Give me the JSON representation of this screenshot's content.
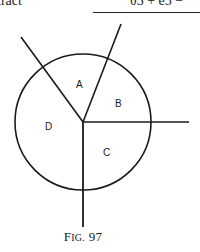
{
  "header": {
    "left_text": "tract",
    "right_text": "θ3 + e5 −"
  },
  "figure": {
    "caption_prefix_big": "F",
    "caption_prefix_small": "IG.",
    "caption_number": "97",
    "circle": {
      "cx": 83,
      "cy": 122,
      "r": 68
    },
    "center": {
      "x": 83,
      "y": 122
    },
    "lines": [
      {
        "name": "upper-left-ray",
        "x2": 21,
        "y2": 37
      },
      {
        "name": "upper-right-ray",
        "x2": 121,
        "y2": 24
      },
      {
        "name": "right-ray",
        "x2": 189,
        "y2": 122
      },
      {
        "name": "down-ray",
        "x2": 83,
        "y2": 227
      }
    ],
    "regions": [
      {
        "label": "A",
        "x": 76,
        "y": 88
      },
      {
        "label": "B",
        "x": 115,
        "y": 107
      },
      {
        "label": "C",
        "x": 103,
        "y": 156
      },
      {
        "label": "D",
        "x": 45,
        "y": 130
      }
    ],
    "stroke_color": "#1a1a1a"
  }
}
